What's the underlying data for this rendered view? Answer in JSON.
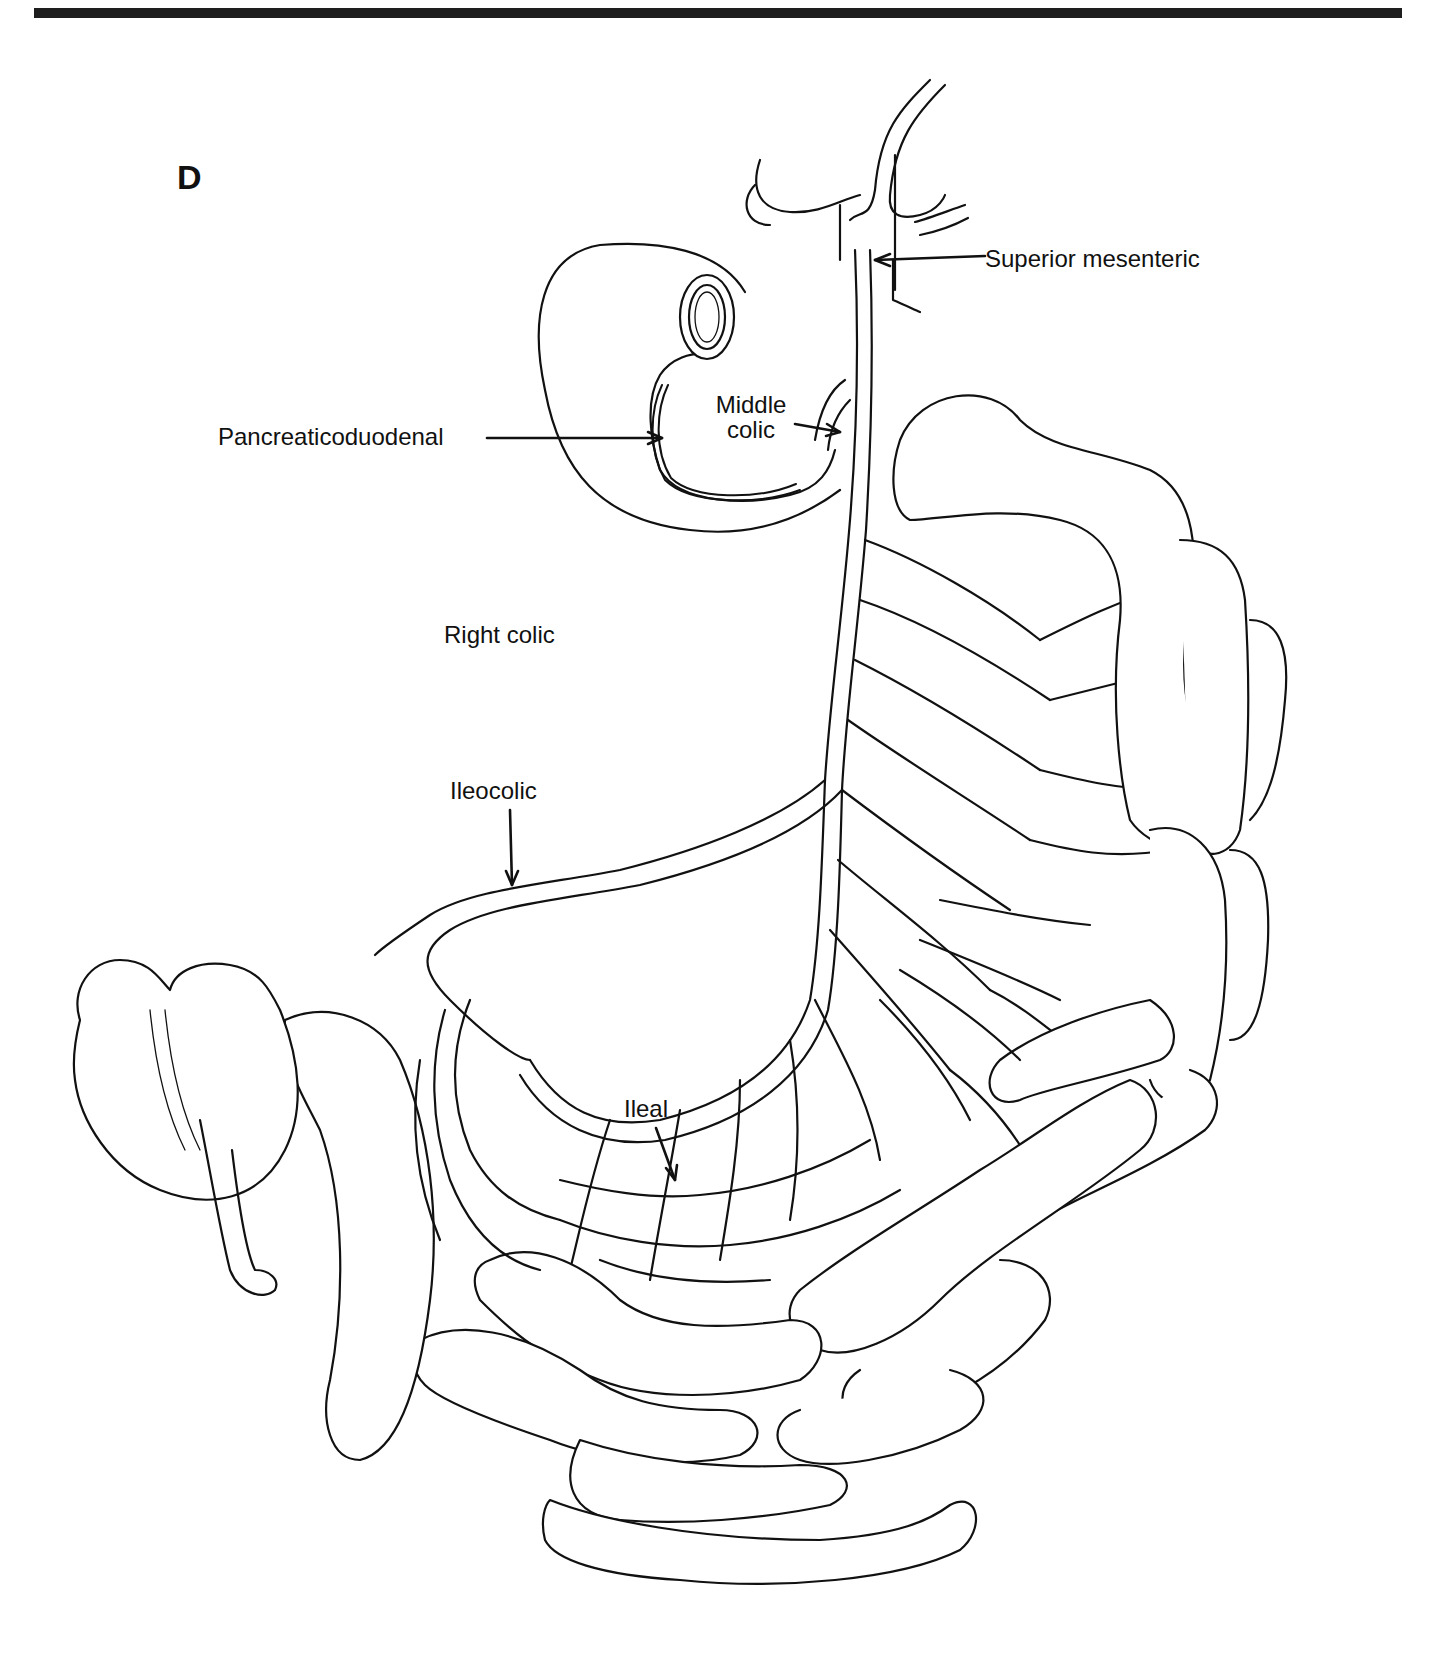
{
  "figure": {
    "panel_letter": "D",
    "labels": {
      "superior_mesenteric": "Superior mesenteric",
      "pancreaticoduodenal": "Pancreaticoduodenal",
      "middle_colic_line1": "Middle",
      "middle_colic_line2": "colic",
      "right_colic": "Right colic",
      "ileocolic": "Ileocolic",
      "ileal": "Ileal"
    },
    "colors": {
      "ink": "#111111",
      "background": "#ffffff",
      "rule": "#1e1e1e"
    }
  }
}
